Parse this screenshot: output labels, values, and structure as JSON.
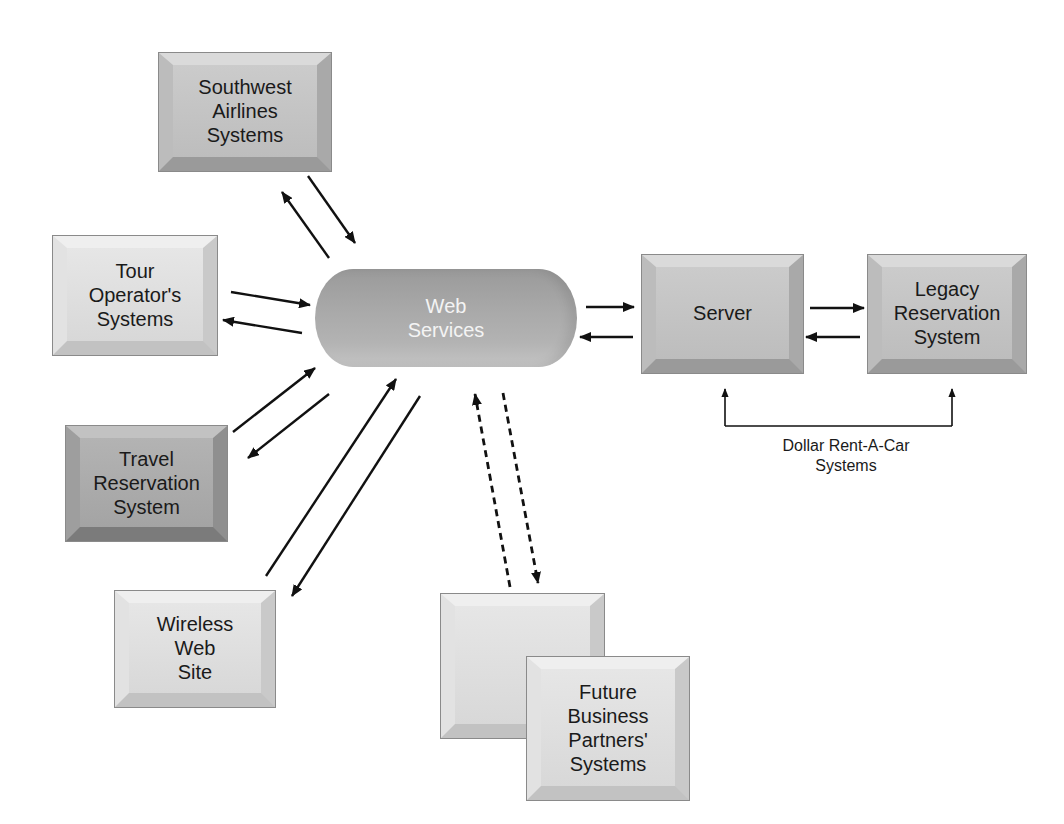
{
  "diagram": {
    "type": "system-architecture",
    "hub": {
      "label_lines": [
        "Web",
        "Services"
      ],
      "shape": "cylinder"
    },
    "nodes": {
      "southwest": {
        "label_lines": [
          "Southwest",
          "Airlines",
          "Systems"
        ]
      },
      "tour_operator": {
        "label_lines": [
          "Tour",
          "Operator's",
          "Systems"
        ]
      },
      "travel_reservation": {
        "label_lines": [
          "Travel",
          "Reservation",
          "System"
        ]
      },
      "wireless": {
        "label_lines": [
          "Wireless",
          "Web",
          "Site"
        ]
      },
      "server": {
        "label_lines": [
          "Server"
        ]
      },
      "legacy": {
        "label_lines": [
          "Legacy",
          "Reservation",
          "System"
        ]
      },
      "future_back": {
        "label_lines": []
      },
      "future_front": {
        "label_lines": [
          "Future",
          "Business",
          "Partners'",
          "Systems"
        ]
      }
    },
    "group_caption": {
      "label_lines": [
        "Dollar Rent-A-Car",
        "Systems"
      ]
    },
    "edges": [
      {
        "from": "southwest",
        "to": "web_services",
        "style": "solid",
        "bidirectional_pair": true
      },
      {
        "from": "tour_operator",
        "to": "web_services",
        "style": "solid",
        "bidirectional_pair": true
      },
      {
        "from": "travel_reservation",
        "to": "web_services",
        "style": "solid",
        "bidirectional_pair": true
      },
      {
        "from": "wireless",
        "to": "web_services",
        "style": "solid",
        "bidirectional_pair": true
      },
      {
        "from": "web_services",
        "to": "server",
        "style": "solid",
        "bidirectional_pair": true
      },
      {
        "from": "server",
        "to": "legacy",
        "style": "solid",
        "bidirectional_pair": true
      },
      {
        "from": "future_partners",
        "to": "web_services",
        "style": "dashed",
        "bidirectional_pair": true
      }
    ],
    "colors": {
      "background": "#ffffff",
      "arrow": "#111111",
      "hub_fill": "#a8a8a8",
      "hub_text": "#f4f4f4",
      "box_light": "#dedede",
      "box_mid": "#c7c7c7",
      "box_dark": "#a9a9a9",
      "text": "#1a1a1a"
    }
  }
}
